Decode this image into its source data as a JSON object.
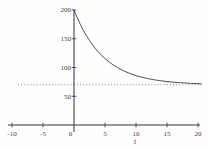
{
  "figure": {
    "background": "#fefefe",
    "curve_color": "#3c3c3c",
    "axis_color": "#333333",
    "tick_label_color": "#3d3d3d",
    "asymptote_color": "#767676"
  },
  "chart_data": {
    "type": "line",
    "title": "",
    "xlabel": "t",
    "ylabel": "",
    "xlim": [
      -10,
      20
    ],
    "ylim": [
      0,
      200
    ],
    "x_ticks": [
      -10,
      -5,
      0,
      5,
      10,
      15,
      20
    ],
    "y_ticks": [
      50,
      100,
      150,
      200
    ],
    "grid": false,
    "legend_position": "none",
    "asymptote_y": 70,
    "approx_function": "y = 70 + 130*exp(-0.21*t)",
    "series": [
      {
        "name": "decay-curve",
        "points": [
          [
            0,
            200
          ],
          [
            0.5,
            187.0
          ],
          [
            1,
            175.4
          ],
          [
            1.5,
            164.9
          ],
          [
            2,
            155.4
          ],
          [
            2.5,
            146.9
          ],
          [
            3,
            139.2
          ],
          [
            3.5,
            132.3
          ],
          [
            4,
            126.1
          ],
          [
            4.5,
            120.5
          ],
          [
            5,
            115.5
          ],
          [
            6,
            106.9
          ],
          [
            7,
            99.9
          ],
          [
            8,
            94.2
          ],
          [
            9,
            89.6
          ],
          [
            10,
            85.9
          ],
          [
            11,
            82.9
          ],
          [
            12,
            80.5
          ],
          [
            13,
            78.5
          ],
          [
            14,
            76.9
          ],
          [
            15,
            75.6
          ],
          [
            16,
            74.5
          ],
          [
            17,
            73.7
          ],
          [
            18,
            73.0
          ],
          [
            19,
            72.4
          ],
          [
            20,
            71.9
          ],
          [
            20.5,
            71.8
          ]
        ]
      }
    ]
  }
}
